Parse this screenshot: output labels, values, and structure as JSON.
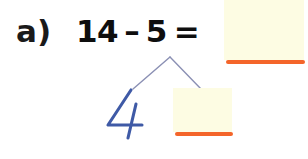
{
  "page": {
    "background_color": "#ffffff",
    "kind": "math-worksheet-problem"
  },
  "problem": {
    "label": "a)",
    "equation": {
      "minuend": "14",
      "operator": "–",
      "subtrahend": "5",
      "equals": "=",
      "full_text": "14 – 5 ="
    },
    "result_blank": {
      "value": "",
      "placeholder": "",
      "fill_color": "#fdfce3",
      "rule_color": "#f4652a"
    }
  },
  "number_bond": {
    "whole_label": "5",
    "branch_color": "#8b90b4",
    "left_part": {
      "value": "4",
      "ink_color": "#3f5aa6",
      "handwritten": true
    },
    "right_part": {
      "value": "",
      "placeholder": "",
      "fill_color": "#fdfce3",
      "rule_color": "#f4652a"
    }
  },
  "colors": {
    "text": "#0e0e0e",
    "blank_fill": "#fdfce3",
    "orange_rule": "#f4652a",
    "pen_blue": "#3f5aa6",
    "branch_grey_blue": "#8b90b4"
  }
}
